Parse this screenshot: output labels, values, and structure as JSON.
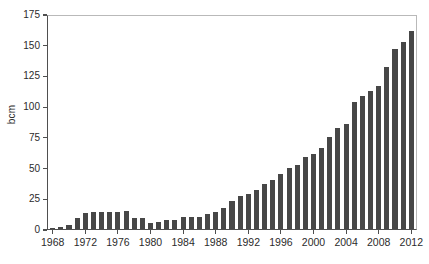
{
  "chart_data": {
    "type": "bar",
    "title": "",
    "subtitle": "",
    "xlabel": "",
    "ylabel": "bcm",
    "xlim": [
      1967.3,
      2012.7
    ],
    "ylim": [
      0,
      175
    ],
    "yticks": [
      0,
      25,
      50,
      75,
      100,
      125,
      150,
      175
    ],
    "xticks": [
      1968,
      1972,
      1976,
      1980,
      1984,
      1988,
      1992,
      1996,
      2000,
      2004,
      2008,
      2012
    ],
    "grid": false,
    "legend": null,
    "bar_color": "#474747",
    "axis_color": "#4f4f4f",
    "frame_color": "#b9b9b9",
    "text_color": "#2b2b2b",
    "categories": [
      1968,
      1969,
      1970,
      1971,
      1972,
      1973,
      1974,
      1975,
      1976,
      1977,
      1978,
      1979,
      1980,
      1981,
      1982,
      1983,
      1984,
      1985,
      1986,
      1987,
      1988,
      1989,
      1990,
      1991,
      1992,
      1993,
      1994,
      1995,
      1996,
      1997,
      1998,
      1999,
      2000,
      2001,
      2002,
      2003,
      2004,
      2005,
      2006,
      2007,
      2008,
      2009,
      2010,
      2011,
      2012
    ],
    "values": [
      0.5,
      1.5,
      3.5,
      9,
      13,
      13.5,
      13.5,
      14,
      14,
      15,
      9,
      9,
      4.5,
      5.5,
      7,
      7,
      9.5,
      10,
      10,
      12,
      13.5,
      17,
      22.5,
      27,
      28.5,
      32,
      36.5,
      40,
      45,
      49.5,
      52,
      59,
      61,
      66,
      75,
      82,
      85.5,
      103.5,
      108.5,
      112,
      116.5,
      131.5,
      146.5,
      152,
      161
    ]
  }
}
